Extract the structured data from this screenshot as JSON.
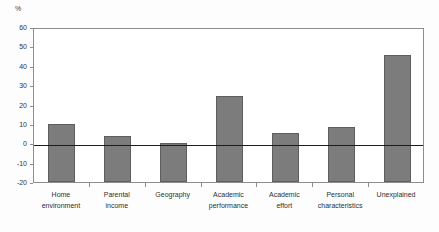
{
  "chart_data": {
    "type": "bar",
    "title": "",
    "subtitle": "",
    "xlabel": "",
    "ylabel": "%",
    "unit_label": "%",
    "categories": [
      "Home\nenvironment",
      "Parental\nincome",
      "Geography",
      "Academic\nperformance",
      "Academic\neffort",
      "Personal\ncharacteristics",
      "Unexplained"
    ],
    "values": [
      10,
      4,
      0,
      24.5,
      5.5,
      8.5,
      45.5
    ],
    "ylim": [
      -20,
      60
    ],
    "yticks": [
      60,
      50,
      40,
      30,
      20,
      10,
      0,
      -10,
      -20
    ],
    "ytick_labels": [
      "60",
      "50",
      "40",
      "30",
      "20",
      "10",
      "0",
      "-10",
      "-20"
    ],
    "grid": false,
    "legend": false,
    "legend_position": "none",
    "zero_line": 0,
    "bars_drawn_from": -20,
    "colors": {
      "bar_fill": "#7c7c7c",
      "bar_edge": "#5e5e5e",
      "axis": "#8d8d8d",
      "zero_line": "#1c1c1c",
      "text": "#2e2e2e",
      "background": "#ffffff"
    }
  }
}
